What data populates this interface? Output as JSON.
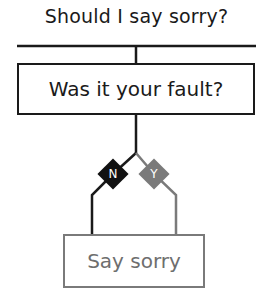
{
  "title": "Should I say sorry?",
  "question": {
    "label": "Was it your fault?"
  },
  "branches": {
    "no": {
      "label": "N",
      "color": "#111111"
    },
    "yes": {
      "label": "Y",
      "color": "#7a7a7a"
    }
  },
  "answer": {
    "label": "Say sorry",
    "color": "#7a7a7a"
  }
}
